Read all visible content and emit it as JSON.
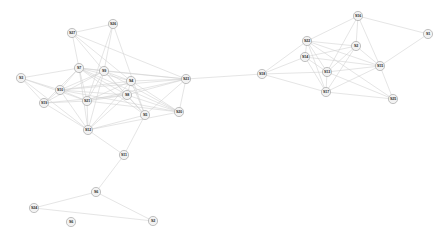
{
  "figure": {
    "title": "",
    "background_color": "#ffffff",
    "node_fill_color": "#f2f2f2",
    "node_stroke_color": "#9a9a9a",
    "edge_color": "#d0d0d0",
    "label_color": "#2b2b2b",
    "width": 444,
    "height": 243
  },
  "chart_data": {
    "type": "diagram",
    "subtype": "node-link-network-graph",
    "title": "",
    "xlabel": "",
    "ylabel": "",
    "grid": false,
    "legend": "none",
    "node_count": 27,
    "edge_count": 86,
    "node_radius": 4.6,
    "nodes": [
      {
        "id": "S1",
        "label": "S1",
        "x": 428,
        "y": 34
      },
      {
        "id": "S2",
        "label": "S2",
        "x": 356,
        "y": 46
      },
      {
        "id": "S3",
        "label": "S3",
        "x": 21,
        "y": 78
      },
      {
        "id": "S4",
        "label": "S4",
        "x": 131,
        "y": 81
      },
      {
        "id": "S5",
        "label": "S5",
        "x": 145,
        "y": 115
      },
      {
        "id": "S6",
        "label": "S6",
        "x": 96,
        "y": 192
      },
      {
        "id": "S7",
        "label": "S7",
        "x": 79,
        "y": 68
      },
      {
        "id": "S8",
        "label": "S8",
        "x": 127,
        "y": 95
      },
      {
        "id": "S9",
        "label": "S9",
        "x": 104,
        "y": 71
      },
      {
        "id": "S10",
        "label": "S10",
        "x": 60,
        "y": 90
      },
      {
        "id": "S11",
        "label": "S11",
        "x": 124,
        "y": 155
      },
      {
        "id": "S12",
        "label": "S12",
        "x": 88,
        "y": 130
      },
      {
        "id": "S13",
        "label": "S13",
        "x": 327,
        "y": 72
      },
      {
        "id": "S14",
        "label": "S14",
        "x": 305,
        "y": 57
      },
      {
        "id": "S15",
        "label": "S15",
        "x": 380,
        "y": 66
      },
      {
        "id": "S16",
        "label": "S16",
        "x": 358,
        "y": 16
      },
      {
        "id": "S17",
        "label": "S17",
        "x": 326,
        "y": 92
      },
      {
        "id": "S18",
        "label": "S18",
        "x": 262,
        "y": 74
      },
      {
        "id": "S19",
        "label": "S19",
        "x": 44,
        "y": 103
      },
      {
        "id": "S20",
        "label": "S20",
        "x": 179,
        "y": 112
      },
      {
        "id": "S21",
        "label": "S21",
        "x": 87,
        "y": 101
      },
      {
        "id": "S22",
        "label": "S22",
        "x": 307,
        "y": 41
      },
      {
        "id": "S23",
        "label": "S23",
        "x": 186,
        "y": 79
      },
      {
        "id": "S24",
        "label": "S24",
        "x": 34,
        "y": 208
      },
      {
        "id": "S25",
        "label": "S25",
        "x": 393,
        "y": 99
      },
      {
        "id": "S26",
        "label": "S26",
        "x": 113,
        "y": 24
      },
      {
        "id": "S27",
        "label": "S27",
        "x": 72,
        "y": 33
      }
    ],
    "edges": [
      [
        "S27",
        "S26"
      ],
      [
        "S27",
        "S7"
      ],
      [
        "S27",
        "S4"
      ],
      [
        "S27",
        "S9"
      ],
      [
        "S27",
        "S23"
      ],
      [
        "S26",
        "S9"
      ],
      [
        "S26",
        "S5"
      ],
      [
        "S26",
        "S21"
      ],
      [
        "S5",
        "S4"
      ],
      [
        "S5",
        "S8"
      ],
      [
        "S5",
        "S23"
      ],
      [
        "S5",
        "S6"
      ],
      [
        "S5",
        "S9"
      ],
      [
        "S5",
        "S7"
      ],
      [
        "S7",
        "S9"
      ],
      [
        "S7",
        "S10"
      ],
      [
        "S7",
        "S21"
      ],
      [
        "S7",
        "S8"
      ],
      [
        "S7",
        "S4"
      ],
      [
        "S7",
        "S12"
      ],
      [
        "S7",
        "S19"
      ],
      [
        "S7",
        "S20"
      ],
      [
        "S7",
        "S23"
      ],
      [
        "S7",
        "S6"
      ],
      [
        "S9",
        "S4"
      ],
      [
        "S9",
        "S8"
      ],
      [
        "S9",
        "S21"
      ],
      [
        "S9",
        "S10"
      ],
      [
        "S9",
        "S12"
      ],
      [
        "S9",
        "S20"
      ],
      [
        "S9",
        "S23"
      ],
      [
        "S9",
        "S6"
      ],
      [
        "S9",
        "S19"
      ],
      [
        "S4",
        "S8"
      ],
      [
        "S4",
        "S23"
      ],
      [
        "S4",
        "S6"
      ],
      [
        "S4",
        "S21"
      ],
      [
        "S4",
        "S10"
      ],
      [
        "S4",
        "S20"
      ],
      [
        "S4",
        "S12"
      ],
      [
        "S8",
        "S21"
      ],
      [
        "S8",
        "S10"
      ],
      [
        "S8",
        "S12"
      ],
      [
        "S8",
        "S6"
      ],
      [
        "S8",
        "S20"
      ],
      [
        "S8",
        "S23"
      ],
      [
        "S8",
        "S19"
      ],
      [
        "S8",
        "S11"
      ],
      [
        "S3",
        "S10"
      ],
      [
        "S3",
        "S7"
      ],
      [
        "S3",
        "S19"
      ],
      [
        "S3",
        "S21"
      ],
      [
        "S3",
        "S12"
      ],
      [
        "S10",
        "S21"
      ],
      [
        "S10",
        "S19"
      ],
      [
        "S10",
        "S12"
      ],
      [
        "S10",
        "S20"
      ],
      [
        "S10",
        "S23"
      ],
      [
        "S21",
        "S19"
      ],
      [
        "S21",
        "S12"
      ],
      [
        "S21",
        "S20"
      ],
      [
        "S21",
        "S23"
      ],
      [
        "S21",
        "S6"
      ],
      [
        "S19",
        "S12"
      ],
      [
        "S19",
        "S21"
      ],
      [
        "S12",
        "S6"
      ],
      [
        "S12",
        "S11"
      ],
      [
        "S12",
        "S20"
      ],
      [
        "S6",
        "S20"
      ],
      [
        "S6",
        "S23"
      ],
      [
        "S6",
        "S11"
      ],
      [
        "S20",
        "S23"
      ],
      [
        "S23",
        "S18"
      ],
      [
        "S11",
        "S12"
      ],
      [
        "S11",
        "S5"
      ],
      [
        "S11",
        "S6b"
      ],
      [
        "S18",
        "S22"
      ],
      [
        "S18",
        "S14"
      ],
      [
        "S18",
        "S13"
      ],
      [
        "S18",
        "S17"
      ],
      [
        "S18",
        "S2"
      ],
      [
        "S22",
        "S2"
      ],
      [
        "S22",
        "S14"
      ],
      [
        "S22",
        "S13"
      ],
      [
        "S22",
        "S17"
      ],
      [
        "S22",
        "S15"
      ],
      [
        "S22",
        "S16"
      ],
      [
        "S22",
        "S25"
      ],
      [
        "S16",
        "S2"
      ],
      [
        "S16",
        "S1"
      ],
      [
        "S16",
        "S13"
      ],
      [
        "S16",
        "S15"
      ],
      [
        "S2",
        "S13"
      ],
      [
        "S2",
        "S14"
      ],
      [
        "S2",
        "S15"
      ],
      [
        "S2",
        "S17"
      ],
      [
        "S14",
        "S13"
      ],
      [
        "S14",
        "S17"
      ],
      [
        "S14",
        "S15"
      ],
      [
        "S14",
        "S2"
      ],
      [
        "S13",
        "S17"
      ],
      [
        "S13",
        "S15"
      ],
      [
        "S13",
        "S25"
      ],
      [
        "S17",
        "S15"
      ],
      [
        "S17",
        "S25"
      ],
      [
        "S15",
        "S1"
      ],
      [
        "S15",
        "S25"
      ],
      [
        "S11",
        "S6c"
      ]
    ],
    "edge_pairs_resolved": [
      [
        "S27",
        "S26"
      ],
      [
        "S27",
        "S7"
      ],
      [
        "S27",
        "S4"
      ],
      [
        "S27",
        "S9"
      ],
      [
        "S27",
        "S23"
      ],
      [
        "S26",
        "S9"
      ],
      [
        "S26",
        "S5"
      ],
      [
        "S26",
        "S21"
      ],
      [
        "S5",
        "S4"
      ],
      [
        "S5",
        "S8"
      ],
      [
        "S5",
        "S23"
      ],
      [
        "S5",
        "S9"
      ],
      [
        "S5",
        "S7"
      ],
      [
        "S5",
        "S11"
      ],
      [
        "S7",
        "S9"
      ],
      [
        "S7",
        "S10"
      ],
      [
        "S7",
        "S21"
      ],
      [
        "S7",
        "S8"
      ],
      [
        "S7",
        "S4"
      ],
      [
        "S7",
        "S12"
      ],
      [
        "S7",
        "S19"
      ],
      [
        "S7",
        "S20"
      ],
      [
        "S7",
        "S23"
      ],
      [
        "S9",
        "S4"
      ],
      [
        "S9",
        "S8"
      ],
      [
        "S9",
        "S21"
      ],
      [
        "S9",
        "S10"
      ],
      [
        "S9",
        "S12"
      ],
      [
        "S9",
        "S20"
      ],
      [
        "S9",
        "S23"
      ],
      [
        "S9",
        "S19"
      ],
      [
        "S4",
        "S8"
      ],
      [
        "S4",
        "S23"
      ],
      [
        "S4",
        "S21"
      ],
      [
        "S4",
        "S10"
      ],
      [
        "S4",
        "S20"
      ],
      [
        "S4",
        "S12"
      ],
      [
        "S8",
        "S21"
      ],
      [
        "S8",
        "S10"
      ],
      [
        "S8",
        "S12"
      ],
      [
        "S8",
        "S20"
      ],
      [
        "S8",
        "S23"
      ],
      [
        "S8",
        "S19"
      ],
      [
        "S3",
        "S10"
      ],
      [
        "S3",
        "S7"
      ],
      [
        "S3",
        "S19"
      ],
      [
        "S3",
        "S21"
      ],
      [
        "S3",
        "S12"
      ],
      [
        "S10",
        "S21"
      ],
      [
        "S10",
        "S19"
      ],
      [
        "S10",
        "S12"
      ],
      [
        "S10",
        "S20"
      ],
      [
        "S10",
        "S23"
      ],
      [
        "S21",
        "S19"
      ],
      [
        "S21",
        "S12"
      ],
      [
        "S21",
        "S20"
      ],
      [
        "S21",
        "S23"
      ],
      [
        "S19",
        "S12"
      ],
      [
        "S12",
        "S11"
      ],
      [
        "S12",
        "S20"
      ],
      [
        "S12",
        "S5"
      ],
      [
        "S20",
        "S23"
      ],
      [
        "S23",
        "S18"
      ],
      [
        "S11",
        "S6"
      ],
      [
        "S6",
        "S24"
      ],
      [
        "S6",
        "S2b"
      ],
      [
        "S24",
        "S2b"
      ],
      [
        "S18",
        "S22"
      ],
      [
        "S18",
        "S14"
      ],
      [
        "S18",
        "S13"
      ],
      [
        "S18",
        "S17"
      ],
      [
        "S22",
        "S2"
      ],
      [
        "S22",
        "S14"
      ],
      [
        "S22",
        "S13"
      ],
      [
        "S22",
        "S17"
      ],
      [
        "S22",
        "S15"
      ],
      [
        "S22",
        "S16"
      ],
      [
        "S22",
        "S25"
      ],
      [
        "S16",
        "S2"
      ],
      [
        "S16",
        "S1"
      ],
      [
        "S16",
        "S13"
      ],
      [
        "S16",
        "S15"
      ],
      [
        "S2",
        "S13"
      ],
      [
        "S2",
        "S14"
      ],
      [
        "S2",
        "S15"
      ],
      [
        "S2",
        "S17"
      ],
      [
        "S14",
        "S13"
      ],
      [
        "S14",
        "S17"
      ],
      [
        "S14",
        "S15"
      ],
      [
        "S13",
        "S17"
      ],
      [
        "S13",
        "S15"
      ],
      [
        "S13",
        "S25"
      ],
      [
        "S17",
        "S15"
      ],
      [
        "S17",
        "S25"
      ],
      [
        "S15",
        "S1"
      ],
      [
        "S15",
        "S25"
      ]
    ],
    "leaf_nodes": [
      {
        "id": "S2b",
        "label": "S2",
        "x": 153,
        "y": 221
      },
      {
        "id": "S6b",
        "label": "S6",
        "x": 71,
        "y": 222
      }
    ],
    "clusters": [
      {
        "name": "left-cluster",
        "members": [
          "S3",
          "S4",
          "S5",
          "S7",
          "S8",
          "S9",
          "S10",
          "S12",
          "S19",
          "S20",
          "S21",
          "S23",
          "S26",
          "S27"
        ]
      },
      {
        "name": "bottom-tail",
        "members": [
          "S11",
          "S6",
          "S24",
          "S2b"
        ]
      },
      {
        "name": "right-cluster",
        "members": [
          "S1",
          "S2",
          "S13",
          "S14",
          "S15",
          "S16",
          "S17",
          "S18",
          "S22",
          "S25"
        ]
      }
    ],
    "bridge_edge": [
      "S23",
      "S18"
    ]
  }
}
